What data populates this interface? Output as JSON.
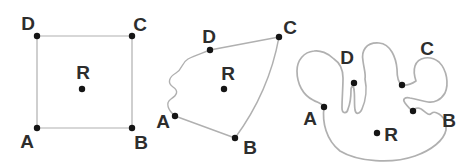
{
  "colors": {
    "background": "#ffffff",
    "curve": "#b0b0b0",
    "dot": "#151515",
    "label": "#2d2d2d"
  },
  "figures": [
    {
      "name": "square-figure",
      "kind": "square region ABCD with interior point R",
      "stroke_width": 1.2,
      "paths": [
        "M 37,36 L 132,36 L 132,128 L 37,128 Z"
      ],
      "points": [
        {
          "label": "D",
          "x": 37,
          "y": 36,
          "lx": 28,
          "ly": 23
        },
        {
          "label": "C",
          "x": 132,
          "y": 36,
          "lx": 140,
          "ly": 24
        },
        {
          "label": "A",
          "x": 37,
          "y": 128,
          "lx": 27,
          "ly": 141
        },
        {
          "label": "B",
          "x": 132,
          "y": 128,
          "lx": 141,
          "ly": 142
        },
        {
          "label": "R",
          "x": 82,
          "y": 89,
          "lx": 83,
          "ly": 72
        }
      ]
    },
    {
      "name": "irregular-quadrilateral-figure",
      "kind": "irregular quadrilateral ABCD with wavy edge AD and interior point R",
      "stroke_width": 1.4,
      "paths": [
        "M 175,116 C 168,110 165,103 171,99 C 177,95 179,91 173,87 C 167,83 169,77 176,73 C 183,69 181,63 188,59 C 195,55 203,53 210,50 L 279,37 Q 269,92 235,138 L 175,116 Z"
      ],
      "points": [
        {
          "label": "D",
          "x": 210,
          "y": 50,
          "lx": 209,
          "ly": 36
        },
        {
          "label": "C",
          "x": 279,
          "y": 37,
          "lx": 290,
          "ly": 27
        },
        {
          "label": "A",
          "x": 175,
          "y": 116,
          "lx": 163,
          "ly": 121
        },
        {
          "label": "B",
          "x": 235,
          "y": 138,
          "lx": 250,
          "ly": 147
        },
        {
          "label": "R",
          "x": 224,
          "y": 89,
          "lx": 228,
          "ly": 73
        }
      ]
    },
    {
      "name": "blob-curve-figure",
      "kind": "closed wiggly curve with points A B C D on inlets and point R",
      "stroke_width": 1.7,
      "paths": [
        "M 324,107 C 322,122 326,140 340,151 C 358,162 392,164 415,156 C 432,150 444,140 446,130 C 447,123 444,116 437,113 C 431,110 432,116 428,114 C 424,112 422,108 418,108 C 416,108 414,109 413,111 C 411,110 408,107 405,103 C 402,99 405,97 410,98 C 416,99 422,101 428,102 C 434,103 441,100 445,93 C 449,84 447,70 439,62 C 430,55 418,57 415,66 C 413,72 415,78 416,81 C 413,83 407,86 402,85 C 398,83 397,76 397,69 C 396,58 391,44 379,43 C 366,42 361,51 363,61 C 364,69 366,74 365,79 C 367,88 366,100 362,109 C 360,114 356,115 355,110 C 354,103 355,95 354,90 C 354,86 351,85 351,90 C 351,96 350,104 348,109 C 347,114 342,114 342,108 C 342,98 343,88 343,78 C 343,70 340,63 334,59 C 328,53 320,50 314,51 C 304,52 297,60 297,71 C 297,84 303,95 313,100 C 318,103 322,103 324,107 Z"
      ],
      "points": [
        {
          "label": "D",
          "x": 354,
          "y": 83,
          "lx": 347,
          "ly": 57
        },
        {
          "label": "C",
          "x": 402,
          "y": 85,
          "lx": 427,
          "ly": 48
        },
        {
          "label": "A",
          "x": 324,
          "y": 107,
          "lx": 310,
          "ly": 118
        },
        {
          "label": "B",
          "x": 413,
          "y": 111,
          "lx": 449,
          "ly": 120
        },
        {
          "label": "R",
          "x": 377,
          "y": 133,
          "lx": 391,
          "ly": 134
        }
      ]
    }
  ],
  "geometry": {
    "dot_radius": 3.2,
    "label_font_size": 19
  }
}
